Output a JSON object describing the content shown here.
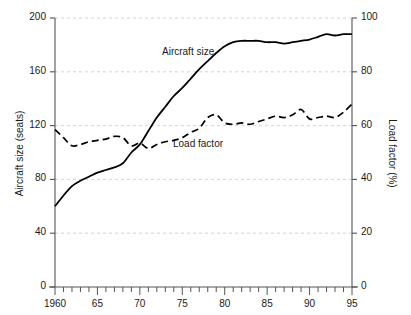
{
  "chart_data": {
    "type": "line",
    "title": "",
    "subtitle": "",
    "xlabel": "",
    "ylabel": "Aircraft size (seats)",
    "y2label": "Load factor (%)",
    "xlim": [
      1960,
      1995
    ],
    "ylim": [
      0,
      200
    ],
    "y2lim": [
      0,
      100
    ],
    "grid": true,
    "grid_axis": "y",
    "legend_position": "inline-annotations",
    "x_major_ticks": [
      1960,
      1965,
      1970,
      1975,
      1980,
      1985,
      1990,
      1995
    ],
    "x_major_tick_labels": [
      "1960",
      "65",
      "70",
      "75",
      "80",
      "85",
      "90",
      "95"
    ],
    "x_minor_tick_interval": 1,
    "y_ticks": [
      0,
      40,
      80,
      120,
      160,
      200
    ],
    "y_tick_labels": [
      "0",
      "40",
      "80",
      "120",
      "160",
      "200"
    ],
    "y2_ticks": [
      0,
      20,
      40,
      60,
      80,
      100
    ],
    "y2_tick_labels": [
      "0",
      "20",
      "40",
      "60",
      "80",
      "100"
    ],
    "x": [
      1960,
      1961,
      1962,
      1963,
      1964,
      1965,
      1966,
      1967,
      1968,
      1969,
      1970,
      1971,
      1972,
      1973,
      1974,
      1975,
      1976,
      1977,
      1978,
      1979,
      1980,
      1981,
      1982,
      1983,
      1984,
      1985,
      1986,
      1987,
      1988,
      1989,
      1990,
      1991,
      1992,
      1993,
      1994,
      1995
    ],
    "series": [
      {
        "name": "Aircraft size",
        "axis": "left",
        "units": "seats",
        "style": "solid",
        "color": "#000000",
        "values": [
          60,
          68,
          75,
          79,
          82,
          85,
          87,
          89,
          92,
          100,
          106,
          116,
          126,
          134,
          142,
          148,
          155,
          162,
          168,
          174,
          179,
          182,
          183,
          183,
          183,
          182,
          182,
          181,
          182,
          183,
          184,
          186,
          188,
          187,
          188,
          188
        ]
      },
      {
        "name": "Load factor",
        "axis": "right",
        "units": "%",
        "style": "dashed",
        "color": "#000000",
        "values": [
          58.5,
          55.5,
          52.5,
          53.0,
          54.0,
          54.5,
          55.0,
          56.0,
          55.5,
          52.5,
          53.5,
          51.5,
          53.0,
          54.0,
          54.5,
          55.5,
          57.5,
          59.0,
          63.0,
          64.0,
          61.0,
          60.5,
          61.0,
          60.5,
          61.5,
          62.5,
          63.5,
          63.0,
          64.0,
          66.0,
          62.5,
          63.0,
          63.5,
          63.0,
          65.0,
          68.0
        ]
      }
    ],
    "annotations": [
      {
        "text": "Aircraft size",
        "x_px": 162,
        "y_px": 46
      },
      {
        "text": "Load factor",
        "x_px": 173,
        "y_px": 138
      }
    ],
    "colors": {
      "axis": "#555555",
      "grid": "#c8c8c8",
      "series": "#000000",
      "text": "#1a1a1a",
      "background": "#ffffff"
    }
  },
  "geometry": {
    "plot_left_px": 55,
    "plot_right_px": 352,
    "plot_top_px": 18,
    "plot_bottom_px": 287
  }
}
